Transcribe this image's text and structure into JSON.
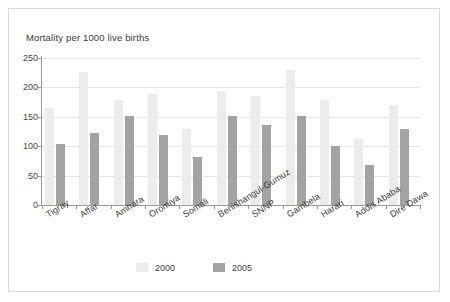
{
  "chart_data": {
    "type": "bar",
    "title": "Mortality per 1000 live births",
    "xlabel": "",
    "ylabel": "",
    "ylim": [
      0,
      250
    ],
    "yticks": [
      0,
      50,
      100,
      150,
      200,
      250
    ],
    "ytick_labels": [
      "0",
      "50",
      "100",
      "150",
      "200",
      "250"
    ],
    "grid": true,
    "legend_position": "bottom-center",
    "categories": [
      "Tigray",
      "Affar",
      "Amhara",
      "Oromiya",
      "Somali",
      "Benishangul-Gumuz",
      "SNNP",
      "Gambela",
      "Harari",
      "Addis Ababa",
      "Dire Dawa"
    ],
    "series": [
      {
        "name": "2000",
        "color": "#ececec",
        "values": [
          165,
          226,
          179,
          188,
          130,
          194,
          186,
          229,
          178,
          112,
          170
        ]
      },
      {
        "name": "2005",
        "color": "#a3a3a3",
        "values": [
          104,
          122,
          152,
          119,
          81,
          152,
          136,
          152,
          100,
          68,
          129
        ]
      }
    ]
  },
  "legend": {
    "items": [
      {
        "label": "2000",
        "color": "#ececec"
      },
      {
        "label": "2005",
        "color": "#a3a3a3"
      }
    ]
  }
}
